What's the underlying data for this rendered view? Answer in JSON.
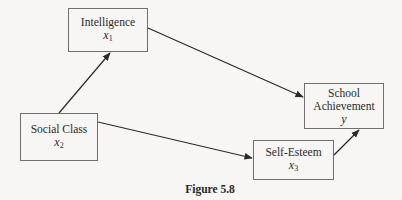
{
  "nodes": {
    "intelligence": {
      "label": "Intelligence",
      "var": "x",
      "sub": "1"
    },
    "social_class": {
      "label": "Social Class",
      "var": "x",
      "sub": "2"
    },
    "self_esteem": {
      "label": "Self-Esteem",
      "var": "x",
      "sub": "3"
    },
    "school_achievement": {
      "label_line1": "School",
      "label_line2": "Achievement",
      "var": "y"
    }
  },
  "edges": [
    {
      "from": "social_class",
      "to": "intelligence"
    },
    {
      "from": "social_class",
      "to": "self_esteem"
    },
    {
      "from": "intelligence",
      "to": "school_achievement"
    },
    {
      "from": "self_esteem",
      "to": "school_achievement"
    }
  ],
  "caption": "Figure 5.8"
}
